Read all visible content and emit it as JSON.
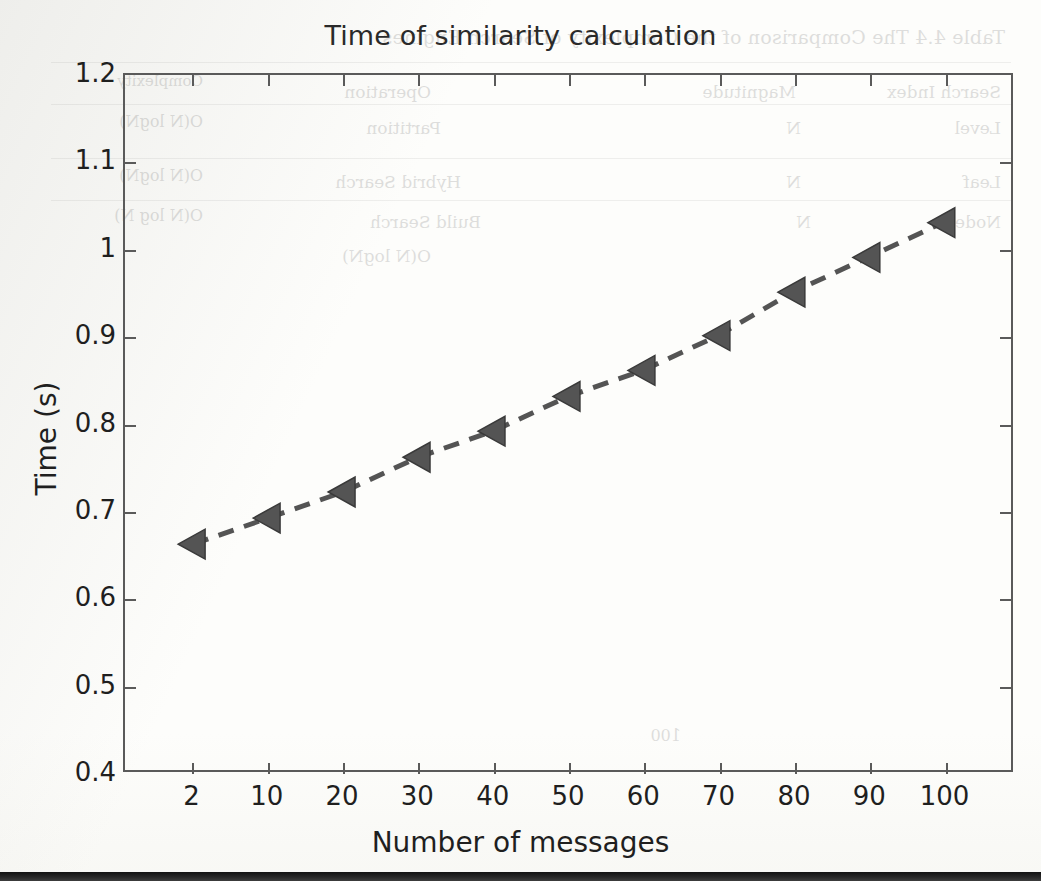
{
  "chart_data": {
    "type": "line",
    "title": "Time of similarity calculation",
    "xlabel": "Number of messages",
    "ylabel": "Time (s)",
    "categories": [
      "2",
      "10",
      "20",
      "30",
      "40",
      "50",
      "60",
      "70",
      "80",
      "90",
      "100"
    ],
    "values": [
      0.66,
      0.69,
      0.72,
      0.76,
      0.79,
      0.83,
      0.86,
      0.9,
      0.95,
      0.99,
      1.03
    ],
    "series": [
      {
        "name": "similarity calculation time",
        "values": [
          0.66,
          0.69,
          0.72,
          0.76,
          0.79,
          0.83,
          0.86,
          0.9,
          0.95,
          0.99,
          1.03
        ]
      }
    ],
    "ylim": [
      0.4,
      1.2
    ],
    "ytick_labels": [
      "1.2",
      "1.1",
      "1",
      "0.9",
      "0.8",
      "0.7",
      "0.6",
      "0.5",
      "0.4"
    ],
    "ytick_values": [
      1.2,
      1.1,
      1.0,
      0.9,
      0.8,
      0.7,
      0.6,
      0.5,
      0.4
    ],
    "xtick_labels": [
      "2",
      "10",
      "20",
      "30",
      "40",
      "50",
      "60",
      "70",
      "80",
      "90",
      "100"
    ],
    "grid": false,
    "legend": "none",
    "line_style": "dashed",
    "marker": "left-triangle",
    "series_color": "#545454",
    "axis_color": "#5a5a5a",
    "text_color": "#1f1f1f"
  },
  "figure": {
    "title": "Time of similarity calculation",
    "x_axis_label": "Number of messages",
    "y_axis_label": "Time (s)"
  },
  "bleed_through": {
    "note": "faint mirrored show-through from the reverse side of the scanned page",
    "title": "Table 4.4  The Comparison of the Complexity of Search Engines",
    "row1": [
      "Search Index",
      "Magnitude",
      "Operation",
      "Complexity"
    ],
    "row2": [
      "Level",
      "N",
      "Partition",
      "O(N logN)"
    ],
    "row3": [
      "Leaf",
      "N",
      "Hybrid Search",
      "O(N logN)"
    ],
    "row4": [
      "Node",
      "N",
      "Build Search",
      "O(N log N)"
    ],
    "row5": "O(N logN)",
    "footer": "100"
  }
}
